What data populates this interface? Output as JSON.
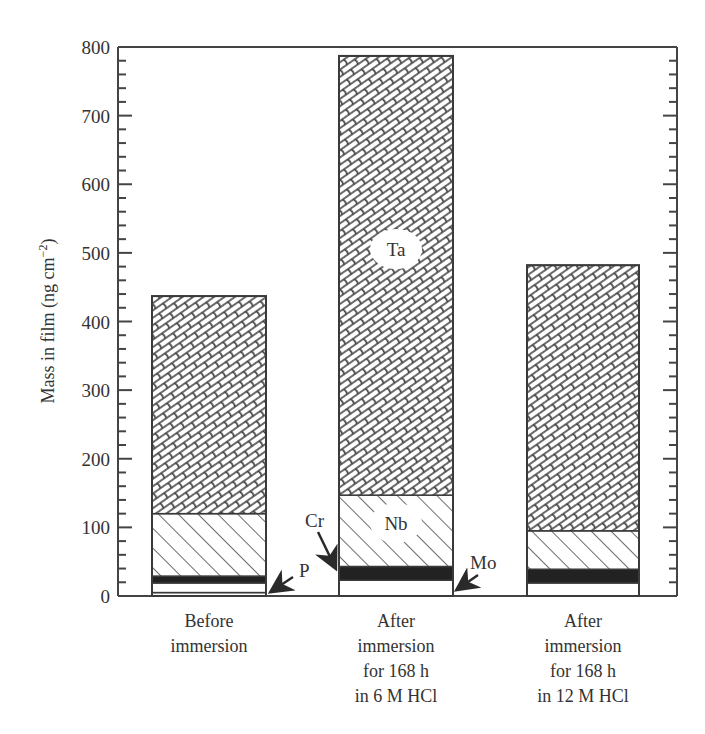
{
  "chart_data": {
    "type": "bar",
    "stacked": true,
    "title": "",
    "xlabel": "",
    "ylabel": "Mass in film (ng cm⁻²)",
    "ylabel_main": "Mass in film (ng cm",
    "ylabel_sup": "−2",
    "ylabel_close": ")",
    "ylim": [
      0,
      800
    ],
    "yticks": [
      0,
      100,
      200,
      300,
      400,
      500,
      600,
      700,
      800
    ],
    "minor_tick_step": 20,
    "grid": false,
    "categories": [
      [
        "Before",
        "immersion"
      ],
      [
        "After",
        "immersion",
        "for 168 h",
        "in 6 M HCl"
      ],
      [
        "After",
        "immersion",
        "for 168 h",
        "in 12 M HCl"
      ]
    ],
    "category_names": [
      "Before immersion",
      "After immersion for 168 h in 6 M HCl",
      "After immersion for 168 h in 12 M HCl"
    ],
    "series": [
      {
        "name": "P",
        "pattern": "dashed-thin",
        "values": [
          5,
          0,
          0
        ]
      },
      {
        "name": "Mo",
        "pattern": "white",
        "values": [
          14,
          23,
          19
        ]
      },
      {
        "name": "Cr",
        "pattern": "solid-black",
        "values": [
          10,
          20,
          20
        ]
      },
      {
        "name": "Nb",
        "pattern": "diagonal-hatch",
        "values": [
          91,
          104,
          56
        ]
      },
      {
        "name": "Ta",
        "pattern": "brick-weave",
        "values": [
          317,
          640,
          387
        ]
      }
    ],
    "totals": [
      437,
      787,
      482
    ],
    "annotations": [
      {
        "text": "Ta",
        "target": "bar 2, Ta layer"
      },
      {
        "text": "Nb",
        "target": "bar 2, Nb layer"
      },
      {
        "text": "Cr",
        "target": "bar 2, Cr layer (arrow)"
      },
      {
        "text": "Mo",
        "target": "bar 2, Mo layer (arrow)"
      },
      {
        "text": "P",
        "target": "bar 1, P layer (arrow)"
      }
    ],
    "legend": "none (inline annotations)"
  },
  "labels": {
    "ta": "Ta",
    "nb": "Nb",
    "cr": "Cr",
    "mo": "Mo",
    "p": "P"
  }
}
